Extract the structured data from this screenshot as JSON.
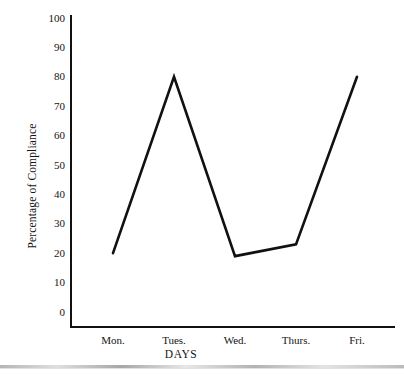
{
  "chart_data": {
    "type": "line",
    "title": "",
    "subtitle": "",
    "xlabel": "DAYS",
    "ylabel": "Percentage of Compliance",
    "categories": [
      "Mon.",
      "Tues.",
      "Wed.",
      "Thurs.",
      "Fri."
    ],
    "values": [
      20,
      80,
      19,
      23,
      80
    ],
    "series": [
      {
        "name": "Percentage of Compliance",
        "values": [
          20,
          80,
          19,
          23,
          80
        ]
      }
    ],
    "ylim": [
      0,
      100
    ],
    "y_ticks": [
      100,
      90,
      80,
      70,
      60,
      50,
      40,
      30,
      20,
      10,
      0
    ],
    "y_tick_labels": [
      "100",
      "90",
      "80",
      "70",
      "60",
      "50",
      "40",
      "30",
      "20",
      "10",
      "0"
    ],
    "x_tick_labels": [
      "Mon.",
      "Tues.",
      "Wed.",
      "Thurs.",
      "Fri."
    ],
    "grid": false,
    "legend": false,
    "legend_position": "none",
    "markers": false,
    "line_color": "#111111",
    "axis_color": "#111111",
    "background_color": "#ffffff",
    "annotations": []
  },
  "figure": {
    "ylabel": "Percentage of Compliance",
    "xlabel": "DAYS",
    "y_ticks": [
      {
        "label": "100",
        "value": 100
      },
      {
        "label": "90",
        "value": 90
      },
      {
        "label": "80",
        "value": 80
      },
      {
        "label": "70",
        "value": 70
      },
      {
        "label": "60",
        "value": 60
      },
      {
        "label": "50",
        "value": 50
      },
      {
        "label": "40",
        "value": 40
      },
      {
        "label": "30",
        "value": 30
      },
      {
        "label": "20",
        "value": 20
      },
      {
        "label": "10",
        "value": 10
      },
      {
        "label": "0",
        "value": 0
      }
    ],
    "x_ticks": [
      {
        "label": "Mon.",
        "value": 20
      },
      {
        "label": "Tues.",
        "value": 80
      },
      {
        "label": "Wed.",
        "value": 19
      },
      {
        "label": "Thurs.",
        "value": 23
      },
      {
        "label": "Fri.",
        "value": 80
      }
    ]
  }
}
